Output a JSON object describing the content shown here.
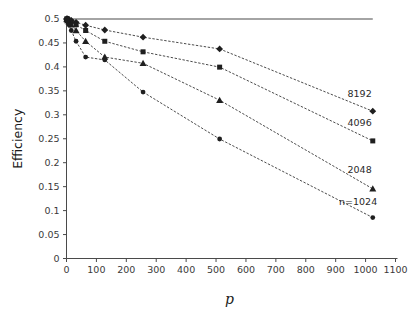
{
  "chart_data": {
    "type": "line",
    "title": "",
    "xlabel": "p",
    "ylabel": "Efficiency",
    "xlim": [
      0,
      1100
    ],
    "ylim": [
      0,
      0.5
    ],
    "grid": false,
    "legend_position": "inline-right",
    "xticks": [
      0,
      100,
      200,
      300,
      400,
      500,
      600,
      700,
      800,
      900,
      1000,
      1100
    ],
    "xtick_labels": [
      "0",
      "100",
      "200",
      "300",
      "400",
      "500",
      "600",
      "700",
      "800",
      "900",
      "1000",
      "1100"
    ],
    "yticks": [
      0,
      0.05,
      0.1,
      0.15,
      0.2,
      0.25,
      0.3,
      0.35,
      0.4,
      0.45,
      0.5
    ],
    "ytick_labels": [
      "0",
      "0.05",
      "0.1",
      "0.15",
      "0.2",
      "0.25",
      "0.3",
      "0.35",
      "0.4",
      "0.45",
      "0.5"
    ],
    "x": [
      1,
      2,
      4,
      8,
      16,
      32,
      64,
      128,
      256,
      512,
      1024
    ],
    "reference_line": {
      "label": "",
      "y": 0.5,
      "x_start": 0,
      "x_end": 1024
    },
    "series": [
      {
        "name": "8192",
        "label": "8192",
        "marker": "diamond",
        "label_x": 980,
        "label_y": 0.345,
        "values": [
          0.5,
          0.5,
          0.5,
          0.499,
          0.497,
          0.493,
          0.487,
          0.477,
          0.462,
          0.4375,
          0.3075
        ]
      },
      {
        "name": "4096",
        "label": "4096",
        "marker": "square",
        "label_x": 980,
        "label_y": 0.283,
        "values": [
          0.5,
          0.5,
          0.499,
          0.497,
          0.494,
          0.488,
          0.476,
          0.4535,
          0.4315,
          0.3995,
          0.2455
        ]
      },
      {
        "name": "2048",
        "label": "2048",
        "marker": "triangle",
        "label_x": 980,
        "label_y": 0.185,
        "values": [
          0.5,
          0.499,
          0.497,
          0.494,
          0.488,
          0.476,
          0.4535,
          0.4205,
          0.4075,
          0.3305,
          0.1455
        ]
      },
      {
        "name": "1024",
        "label": "n=1024",
        "marker": "circle",
        "label_x": 975,
        "label_y": 0.118,
        "values": [
          0.5,
          0.498,
          0.494,
          0.488,
          0.476,
          0.4535,
          0.4205,
          0.4145,
          0.3475,
          0.2495,
          0.0855
        ]
      }
    ],
    "colors": {
      "axis": "#4a4a4a",
      "marker": "#1f1f1f",
      "line": "#2b2b2b",
      "text": "#1a1a1a",
      "background": "#ffffff"
    }
  }
}
